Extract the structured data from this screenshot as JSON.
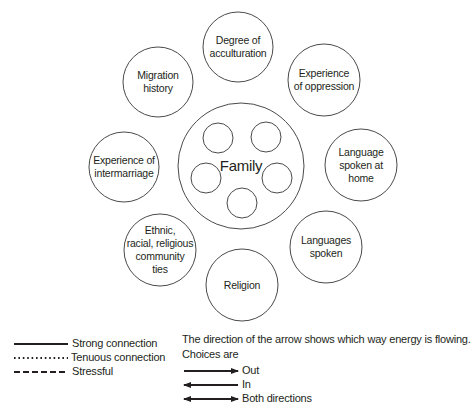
{
  "diagram": {
    "center": {
      "label": "Family",
      "inner_circle_count": 5
    },
    "nodes": [
      {
        "id": "degree-of-acculturation",
        "label": "Degree of\nacculturation"
      },
      {
        "id": "experience-of-oppression",
        "label": "Experience\nof oppression"
      },
      {
        "id": "language-spoken-at-home",
        "label": "Language\nspoken at\nhome"
      },
      {
        "id": "languages-spoken",
        "label": "Languages\nspoken"
      },
      {
        "id": "religion",
        "label": "Religion"
      },
      {
        "id": "ethnic-community-ties",
        "label": "Ethnic,\nracial, religious\ncommunity\nties"
      },
      {
        "id": "experience-of-intermarriage",
        "label": "Experience of\nintermarriage"
      },
      {
        "id": "migration-history",
        "label": "Migration\nhistory"
      }
    ]
  },
  "legend": {
    "line_styles": [
      {
        "style": "solid",
        "label": "Strong connection"
      },
      {
        "style": "dotted",
        "label": "Tenuous connection"
      },
      {
        "style": "dashed",
        "label": "Stressful"
      }
    ],
    "direction_intro": "The direction of the arrow shows which way energy is flowing.",
    "choices_label": "Choices are",
    "arrows": [
      {
        "direction": "right",
        "label": "Out"
      },
      {
        "direction": "left",
        "label": "In"
      },
      {
        "direction": "both",
        "label": "Both directions"
      }
    ]
  },
  "colors": {
    "stroke": "#4a4a4a",
    "text": "#231f20",
    "legend_line": "#231f20"
  }
}
